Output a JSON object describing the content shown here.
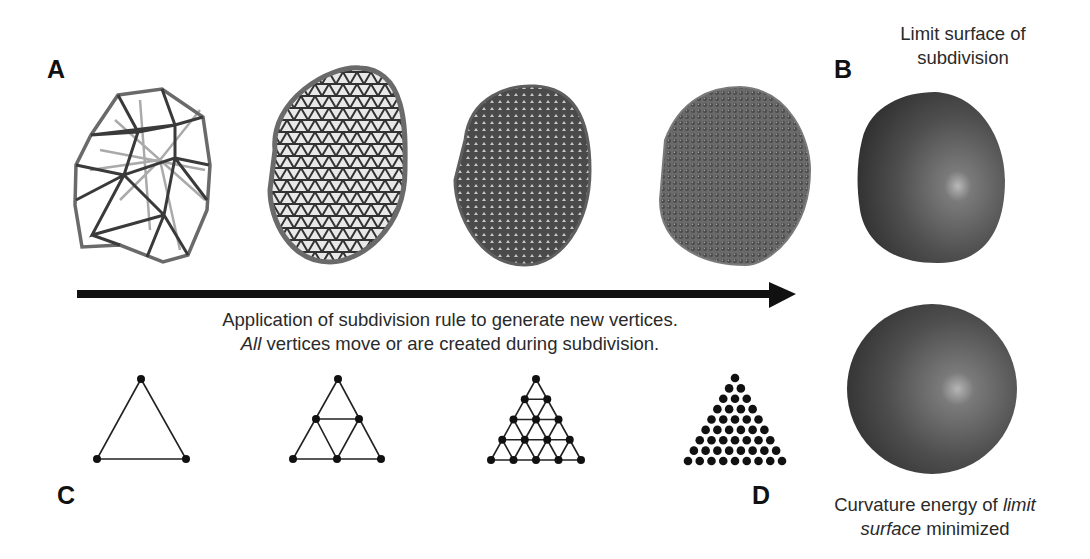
{
  "panels": {
    "A": {
      "label": "A"
    },
    "B": {
      "label": "B",
      "caption_line1": "Limit surface of",
      "caption_line2": "subdivision"
    },
    "C": {
      "label": "C"
    },
    "D": {
      "label": "D",
      "caption_line1_pre": "Curvature energy of ",
      "caption_line1_italic": "limit",
      "caption_line2_italic": "surface",
      "caption_line2_post": " minimized"
    }
  },
  "arrow": {
    "caption_line1": "Application of subdivision rule to generate new vertices.",
    "caption_line2_italic": "All",
    "caption_line2_post": " vertices move or are created during subdivision."
  },
  "meshes": [
    {
      "name": "coarse-icosahedral-mesh",
      "level": 0
    },
    {
      "name": "subdivided-mesh-level-1",
      "level": 1
    },
    {
      "name": "subdivided-mesh-level-2",
      "level": 2
    },
    {
      "name": "subdivided-mesh-level-3",
      "level": 3
    }
  ],
  "triangles": [
    {
      "name": "triangle-subdivision-0",
      "rows": 1
    },
    {
      "name": "triangle-subdivision-1",
      "rows": 2
    },
    {
      "name": "triangle-subdivision-2",
      "rows": 4
    },
    {
      "name": "triangle-subdivision-3",
      "rows": 8
    }
  ],
  "spheres": [
    {
      "name": "limit-surface-sphere"
    },
    {
      "name": "minimized-energy-sphere"
    }
  ],
  "colors": {
    "ink": "#111111",
    "mesh_dark": "#3a3a3a",
    "mesh_light": "#9a9a9a",
    "sphere_base": "#5a5a5a"
  }
}
